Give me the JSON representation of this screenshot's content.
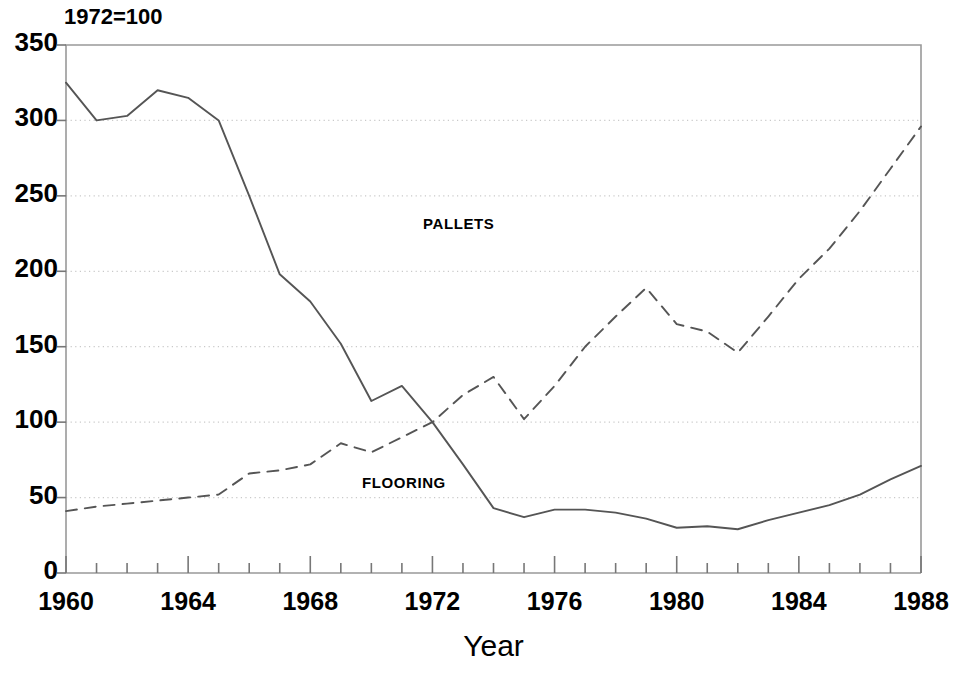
{
  "chart_data": {
    "type": "line",
    "title": "",
    "note": "1972=100",
    "xlabel": "Year",
    "ylabel": "",
    "xlim": [
      1960,
      1988
    ],
    "ylim": [
      0,
      350
    ],
    "grid": true,
    "grid_axis": "y",
    "legend": "inline-annotations",
    "x_tick_step": 1,
    "x_label_step": 4,
    "y_tick_step": 50,
    "x_tick_labels": [
      "1960",
      "1964",
      "1968",
      "1972",
      "1976",
      "1980",
      "1984",
      "1988"
    ],
    "y_tick_labels": [
      "0",
      "50",
      "100",
      "150",
      "200",
      "250",
      "300",
      "350"
    ],
    "x": [
      1960,
      1961,
      1962,
      1963,
      1964,
      1965,
      1966,
      1967,
      1968,
      1969,
      1970,
      1971,
      1972,
      1973,
      1974,
      1975,
      1976,
      1977,
      1978,
      1979,
      1980,
      1981,
      1982,
      1983,
      1984,
      1985,
      1986,
      1987,
      1988
    ],
    "series": [
      {
        "name": "PALLETS",
        "style": "solid",
        "color": "#555555",
        "label_x": 1973,
        "label_y": 232,
        "values": [
          325,
          300,
          303,
          320,
          315,
          300,
          250,
          198,
          180,
          152,
          114,
          124,
          100,
          72,
          43,
          37,
          42,
          42,
          40,
          36,
          30,
          31,
          29,
          35,
          40,
          45,
          52,
          62,
          71
        ]
      },
      {
        "name": "FLOORING",
        "style": "dashed",
        "color": "#555555",
        "label_x": 1971,
        "label_y": 60,
        "values": [
          41,
          44,
          46,
          48,
          50,
          52,
          66,
          68,
          72,
          86,
          80,
          90,
          100,
          118,
          130,
          102,
          124,
          150,
          170,
          189,
          165,
          160,
          146,
          170,
          195,
          215,
          240,
          268,
          296
        ]
      }
    ]
  },
  "annotations": {
    "pallets_label": "PALLETS",
    "flooring_label": "FLOORING"
  }
}
